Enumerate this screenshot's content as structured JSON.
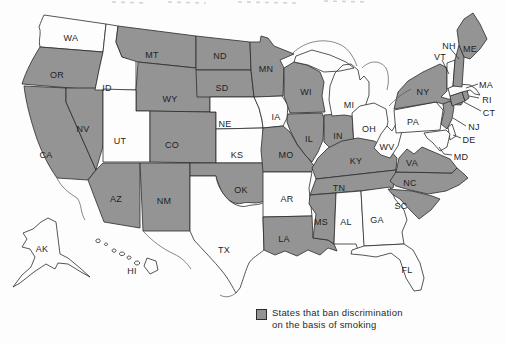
{
  "legend": {
    "swatch_color": "#949494",
    "line1": "States that ban discrimination",
    "line2": "on the basis of smoking"
  },
  "map": {
    "ban_fill": "#949494",
    "non_ban_fill": "#fdfdfd",
    "border_color": "#2b2b2b",
    "label_color": "#1f1f1f",
    "states": [
      {
        "abbr": "WA",
        "bans": false
      },
      {
        "abbr": "OR",
        "bans": true
      },
      {
        "abbr": "CA",
        "bans": true
      },
      {
        "abbr": "NV",
        "bans": true
      },
      {
        "abbr": "ID",
        "bans": false
      },
      {
        "abbr": "MT",
        "bans": true
      },
      {
        "abbr": "WY",
        "bans": true
      },
      {
        "abbr": "UT",
        "bans": false
      },
      {
        "abbr": "CO",
        "bans": true
      },
      {
        "abbr": "AZ",
        "bans": true
      },
      {
        "abbr": "NM",
        "bans": true
      },
      {
        "abbr": "ND",
        "bans": true
      },
      {
        "abbr": "SD",
        "bans": true
      },
      {
        "abbr": "NE",
        "bans": false
      },
      {
        "abbr": "KS",
        "bans": false
      },
      {
        "abbr": "OK",
        "bans": true
      },
      {
        "abbr": "TX",
        "bans": false
      },
      {
        "abbr": "MN",
        "bans": true
      },
      {
        "abbr": "IA",
        "bans": false
      },
      {
        "abbr": "MO",
        "bans": true
      },
      {
        "abbr": "AR",
        "bans": false
      },
      {
        "abbr": "LA",
        "bans": true
      },
      {
        "abbr": "WI",
        "bans": true
      },
      {
        "abbr": "IL",
        "bans": true
      },
      {
        "abbr": "IN",
        "bans": true
      },
      {
        "abbr": "MI",
        "bans": false
      },
      {
        "abbr": "OH",
        "bans": false
      },
      {
        "abbr": "KY",
        "bans": true
      },
      {
        "abbr": "TN",
        "bans": true
      },
      {
        "abbr": "MS",
        "bans": true
      },
      {
        "abbr": "AL",
        "bans": false
      },
      {
        "abbr": "GA",
        "bans": false
      },
      {
        "abbr": "FL",
        "bans": false
      },
      {
        "abbr": "SC",
        "bans": true
      },
      {
        "abbr": "NC",
        "bans": true
      },
      {
        "abbr": "VA",
        "bans": true
      },
      {
        "abbr": "WV",
        "bans": false
      },
      {
        "abbr": "PA",
        "bans": false
      },
      {
        "abbr": "NY",
        "bans": true
      },
      {
        "abbr": "NJ",
        "bans": true
      },
      {
        "abbr": "DE",
        "bans": false
      },
      {
        "abbr": "MD",
        "bans": false
      },
      {
        "abbr": "CT",
        "bans": true
      },
      {
        "abbr": "RI",
        "bans": true
      },
      {
        "abbr": "MA",
        "bans": false
      },
      {
        "abbr": "VT",
        "bans": false
      },
      {
        "abbr": "NH",
        "bans": true
      },
      {
        "abbr": "ME",
        "bans": true
      },
      {
        "abbr": "AK",
        "bans": false
      },
      {
        "abbr": "HI",
        "bans": false
      }
    ],
    "callout_states": [
      "NH",
      "VT",
      "MA",
      "RI",
      "CT",
      "NJ",
      "DE",
      "MD"
    ]
  }
}
